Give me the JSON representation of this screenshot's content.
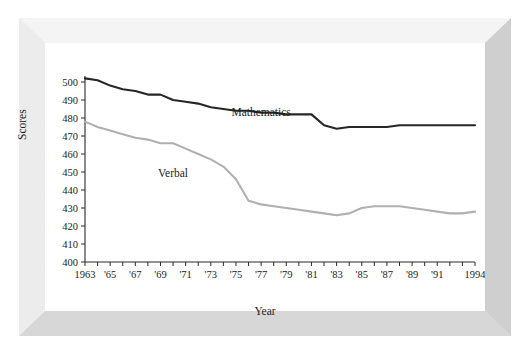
{
  "chart_data": {
    "type": "line",
    "title": "",
    "xlabel": "Year",
    "ylabel": "Scores",
    "ylim": [
      400,
      500
    ],
    "xlim": [
      1963,
      1994
    ],
    "grid": false,
    "legend_position": "inline-annotations",
    "ytick_labels": [
      "400",
      "410",
      "420",
      "430",
      "440",
      "450",
      "460",
      "470",
      "480",
      "490",
      "500"
    ],
    "ytick_values": [
      400,
      410,
      420,
      430,
      440,
      450,
      460,
      470,
      480,
      490,
      500
    ],
    "xtick_labels": [
      "1963",
      "'65",
      "'67",
      "'69",
      "'71",
      "'73",
      "'75",
      "'77",
      "'79",
      "'81",
      "'83",
      "'85",
      "'87",
      "'89",
      "'91",
      "1994"
    ],
    "xtick_values": [
      1963,
      1965,
      1967,
      1969,
      1971,
      1973,
      1975,
      1977,
      1979,
      1981,
      1983,
      1985,
      1987,
      1989,
      1991,
      1994
    ],
    "x": [
      1963,
      1964,
      1965,
      1966,
      1967,
      1968,
      1969,
      1970,
      1971,
      1972,
      1973,
      1974,
      1975,
      1976,
      1977,
      1978,
      1979,
      1980,
      1981,
      1982,
      1983,
      1984,
      1985,
      1986,
      1987,
      1988,
      1989,
      1990,
      1991,
      1992,
      1993,
      1994
    ],
    "series": [
      {
        "name": "Mathematics",
        "color": "#262626",
        "label_x": 1977,
        "label_y": 481,
        "values": [
          502,
          501,
          498,
          496,
          495,
          493,
          493,
          490,
          489,
          488,
          486,
          485,
          484,
          484,
          483,
          483,
          482,
          482,
          482,
          476,
          474,
          475,
          475,
          475,
          475,
          476,
          476,
          476,
          476,
          476,
          476,
          476
        ]
      },
      {
        "name": "Verbal",
        "color": "#b0b0b0",
        "label_x": 1970,
        "label_y": 447,
        "values": [
          478,
          475,
          473,
          471,
          469,
          468,
          466,
          466,
          463,
          460,
          457,
          453,
          446,
          434,
          432,
          431,
          430,
          429,
          428,
          427,
          426,
          427,
          430,
          431,
          431,
          431,
          430,
          429,
          428,
          427,
          427,
          428
        ]
      }
    ],
    "annotations": [
      {
        "text": "Mathematics",
        "x": 1977,
        "y": 481
      },
      {
        "text": "Verbal",
        "x": 1970,
        "y": 447
      }
    ]
  },
  "axes": {
    "y_title": "Scores",
    "x_title": "Year"
  }
}
